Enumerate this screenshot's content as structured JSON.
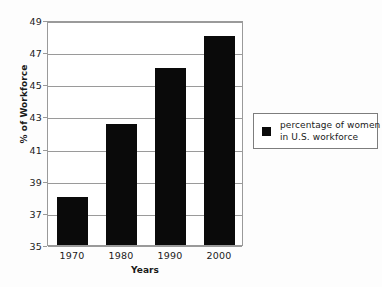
{
  "chart_data": {
    "type": "bar",
    "title": "",
    "subtitle": "",
    "categories": [
      "1970",
      "1980",
      "1990",
      "2000"
    ],
    "values": [
      38,
      42.5,
      46,
      48
    ],
    "series": [
      {
        "name": "percentage of women in U.S. workforce",
        "values": [
          38,
          42.5,
          46,
          48
        ]
      }
    ],
    "xlabel": "Years",
    "ylabel": "% of Workforce",
    "ylim": [
      35,
      49
    ],
    "yticks": [
      49,
      47,
      45,
      43,
      41,
      39,
      37,
      35
    ],
    "ytick_labels": [
      "49",
      "47",
      "45",
      "43",
      "41",
      "39",
      "37",
      "35"
    ],
    "grid": true,
    "grid_axis": "y",
    "legend": {
      "position": "right",
      "entries": [
        {
          "line1": "percentage of women",
          "line2": "in U.S. workforce",
          "color": "#0a0a0a",
          "swatch": "filled-square"
        }
      ]
    },
    "colors": {
      "bar": "#0a0a0a",
      "grid": "#9a9a9a",
      "axis": "#9a9a9a",
      "text": "#1a1a1a",
      "plot_background": "#ffffff",
      "figure_background": "#fdfdfd",
      "legend_border": "#7d7d7d"
    }
  }
}
